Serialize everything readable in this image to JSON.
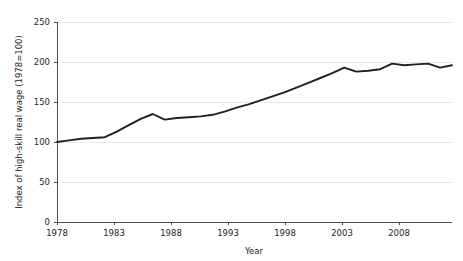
{
  "chart_data": {
    "type": "line",
    "title": "",
    "xlabel": "Year",
    "ylabel": "Index of high-skill real wage (1978=100)",
    "xlim": [
      1978,
      2011
    ],
    "ylim": [
      0,
      250
    ],
    "xticks": [
      1978,
      1983,
      1988,
      1993,
      1998,
      2003,
      2008
    ],
    "yticks": [
      0,
      50,
      100,
      150,
      200,
      250
    ],
    "grid": "horizontal",
    "legend": "none",
    "line_color": "#231f20",
    "x": [
      1978,
      1979,
      1980,
      1981,
      1982,
      1983,
      1984,
      1985,
      1986,
      1987,
      1988,
      1989,
      1990,
      1991,
      1992,
      1993,
      1994,
      1995,
      1996,
      1997,
      1998,
      1999,
      2000,
      2001,
      2002,
      2003,
      2004,
      2005,
      2006,
      2007,
      2008,
      2009,
      2010,
      2011
    ],
    "series": [
      {
        "name": "Index of high-skill real wage (1978=100)",
        "values": [
          100,
          102,
          104,
          105,
          106,
          113,
          121,
          129,
          135,
          128,
          130,
          131,
          132,
          134,
          138,
          143,
          147,
          152,
          157,
          162,
          168,
          174,
          180,
          186,
          193,
          188,
          189,
          191,
          198,
          196,
          197,
          198,
          193,
          196
        ]
      }
    ]
  },
  "axes": {
    "y_tick_labels": [
      "250",
      "200",
      "150",
      "100",
      "50",
      "0"
    ],
    "x_tick_labels": [
      "1978",
      "1983",
      "1988",
      "1993",
      "1998",
      "2003",
      "2008"
    ],
    "x_axis_title": "Year",
    "y_axis_title": "Index of high-skill real wage (1978=100)"
  }
}
